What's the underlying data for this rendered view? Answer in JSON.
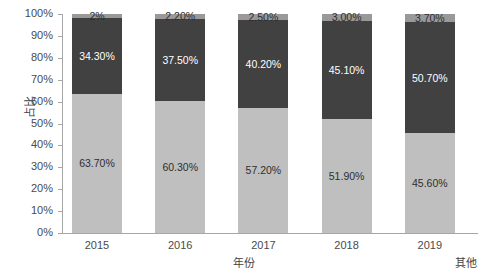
{
  "chart_data": {
    "type": "bar",
    "subtype": "stacked-percent",
    "title": "",
    "xlabel": "年份",
    "ylabel": "占比",
    "categories": [
      "2015",
      "2016",
      "2017",
      "2018",
      "2019"
    ],
    "ylim": [
      0,
      100
    ],
    "ytick_labels": [
      "0%",
      "10%",
      "20%",
      "30%",
      "40%",
      "50%",
      "60%",
      "70%",
      "80%",
      "90%",
      "100%"
    ],
    "ytick_values": [
      0,
      10,
      20,
      30,
      40,
      50,
      60,
      70,
      80,
      90,
      100
    ],
    "grid": false,
    "legend_position": "bottom-right",
    "series": [
      {
        "name": "bottom-series",
        "color": "#bfbfbf",
        "values": [
          63.7,
          60.3,
          57.2,
          51.9,
          45.6
        ],
        "labels": [
          "63.70%",
          "60.30%",
          "57.20%",
          "51.90%",
          "45.60%"
        ]
      },
      {
        "name": "middle-series",
        "color": "#414141",
        "values": [
          34.3,
          37.5,
          40.2,
          45.1,
          50.7
        ],
        "labels": [
          "34.30%",
          "37.50%",
          "40.20%",
          "45.10%",
          "50.70%"
        ]
      },
      {
        "name": "其他",
        "color": "#999999",
        "values": [
          2.0,
          2.2,
          2.5,
          3.0,
          3.7
        ],
        "labels": [
          "2%",
          "2.20%",
          "2.50%",
          "3.00%",
          "3.70%"
        ]
      }
    ],
    "legend_entries": [
      "其他"
    ]
  },
  "axes": {
    "y_title": "占比",
    "x_title": "年份",
    "y_ticks": [
      "100%",
      "90%",
      "80%",
      "70%",
      "60%",
      "50%",
      "40%",
      "30%",
      "20%",
      "10%",
      "0%"
    ],
    "x_ticks": [
      "2015",
      "2016",
      "2017",
      "2018",
      "2019"
    ]
  },
  "legend": {
    "other_label": "其他"
  },
  "bars": [
    {
      "category": "2015",
      "bottom_label": "63.70%",
      "middle_label": "34.30%",
      "top_label": "2%"
    },
    {
      "category": "2016",
      "bottom_label": "60.30%",
      "middle_label": "37.50%",
      "top_label": "2.20%"
    },
    {
      "category": "2017",
      "bottom_label": "57.20%",
      "middle_label": "40.20%",
      "top_label": "2.50%"
    },
    {
      "category": "2018",
      "bottom_label": "51.90%",
      "middle_label": "45.10%",
      "top_label": "3.00%"
    },
    {
      "category": "2019",
      "bottom_label": "45.60%",
      "middle_label": "50.70%",
      "top_label": "3.70%"
    }
  ],
  "colors": {
    "bottom": "#bfbfbf",
    "middle": "#414141",
    "top": "#999999",
    "axis": "#a6a6a6",
    "text": "#4a4a4a",
    "background": "#ffffff"
  }
}
